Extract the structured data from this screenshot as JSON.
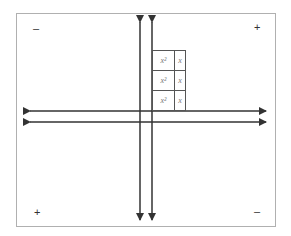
{
  "diagram": {
    "title": "",
    "quadrant_signs": {
      "top_left": "–",
      "top_right": "+",
      "bottom_left": "+",
      "bottom_right": "–"
    },
    "tiles": [
      {
        "row": 0,
        "col": 0,
        "label": "x²"
      },
      {
        "row": 0,
        "col": 1,
        "label": "x"
      },
      {
        "row": 1,
        "col": 0,
        "label": "x²"
      },
      {
        "row": 1,
        "col": 1,
        "label": "x"
      },
      {
        "row": 2,
        "col": 0,
        "label": "x²"
      },
      {
        "row": 2,
        "col": 1,
        "label": "x"
      }
    ],
    "colors": {
      "axis": "#333333",
      "border": "#b0b0b0",
      "tile_border": "#555555",
      "tile_text": "#777777"
    }
  }
}
